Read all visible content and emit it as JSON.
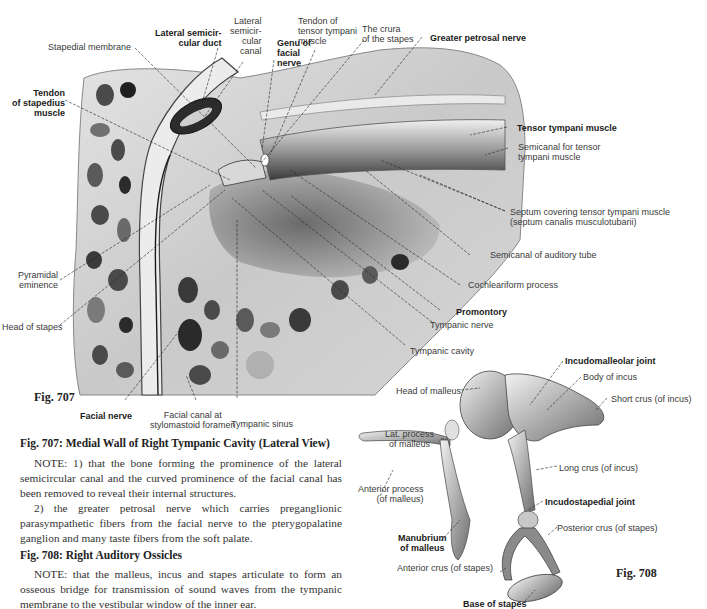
{
  "fig707": {
    "label": "Fig. 707",
    "caption": "Fig. 707: Medial Wall of Right Tympanic Cavity (Lateral View)",
    "labels": {
      "stapedial_membrane": "Stapedial membrane",
      "lateral_semicircular_duct": "Lateral semicir-\ncular duct",
      "lateral_semicircular_canal": "Lateral\nsemicir-\ncular\ncanal",
      "genu_facial_nerve": "Genu of\nfacial\nnerve",
      "tendon_tensor_tympani": "Tendon of\ntensor tympani\nmuscle",
      "crura_of_stapes": "The crura\nof the stapes",
      "greater_petrosal_nerve": "Greater petrosal nerve",
      "tendon_stapedius": "Tendon\nof stapedius\nmuscle",
      "tensor_tympani_muscle": "Tensor tympani muscle",
      "semicanal_tensor_tympani": "Semicanal for tensor\ntympani muscle",
      "septum": "Septum covering tensor tympani muscle\n(septum canalis musculotubarii)",
      "semicanal_auditory_tube": "Semicanal of auditory tube",
      "cochleariform_process": "Cochleariform process",
      "promontory": "Promontory",
      "tympanic_nerve": "Tympanic nerve",
      "tympanic_cavity": "Tympanic cavity",
      "pyramidal_eminence": "Pyramidal\neminence",
      "head_of_stapes": "Head of stapes",
      "facial_nerve": "Facial nerve",
      "facial_canal_stylomastoid": "Facial canal at\nstylomastoid foramen",
      "tympanic_sinus": "Tympanic sinus"
    },
    "notes": [
      "NOTE: 1) that the bone forming the prominence of the lateral semicircular canal and the curved prominence of the facial canal has been removed to reveal their internal structures.",
      "2) the greater petrosal nerve which carries preganglionic parasympathetic fibers from the facial nerve to the pterygopalatine ganglion and many taste fibers from the soft palate."
    ]
  },
  "fig708": {
    "label": "Fig. 708",
    "caption": "Fig. 708: Right Auditory Ossicles",
    "labels": {
      "incudomalleolar_joint": "Incudomalleolar joint",
      "body_of_incus": "Body of incus",
      "head_of_malleus": "Head of malleus",
      "short_crus_incus": "Short crus (of incus)",
      "lat_process_malleus": "Lat. process\nof malleus",
      "long_crus_incus": "Long crus (of incus)",
      "anterior_process_malleus": "Anterior process\n(of malleus)",
      "incudostapedial_joint": "Incudostapedial joint",
      "posterior_crus_stapes": "Posterior crus (of stapes)",
      "manubrium_malleus": "Manubrium\nof malleus",
      "anterior_crus_stapes": "Anterior crus (of stapes)",
      "base_of_stapes": "Base of stapes"
    },
    "notes": [
      "NOTE: that the malleus, incus and stapes articulate to form an osseous bridge for transmission of sound waves from the tympanic membrane to the vestibular window of the inner ear."
    ]
  },
  "colors": {
    "bone_light": "#d9d9d9",
    "bone_mid": "#a8a8a8",
    "cavity_dark": "#3a3a3a",
    "ink": "#222222"
  }
}
